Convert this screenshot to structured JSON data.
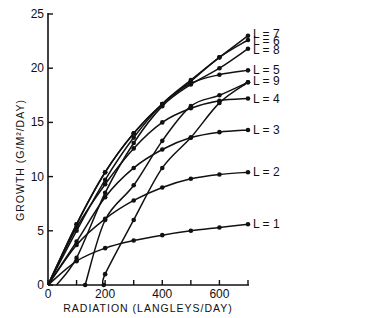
{
  "chart_data": {
    "type": "line",
    "title": "",
    "xlabel": "RADIATION (LANGLEYS/DAY)",
    "ylabel": "GROWTH (G/M²/DAY)",
    "xlim": [
      0,
      700
    ],
    "ylim": [
      0,
      25
    ],
    "x_ticks": [
      0,
      100,
      200,
      300,
      400,
      500,
      600,
      700
    ],
    "x_tick_labels": [
      "0",
      "",
      "200",
      "",
      "400",
      "",
      "600",
      ""
    ],
    "y_ticks": [
      0,
      5,
      10,
      15,
      20,
      25
    ],
    "y_tick_labels": [
      "0",
      "5",
      "10",
      "15",
      "20",
      "25"
    ],
    "grid": false,
    "legend_position": "inline-right",
    "series": [
      {
        "name": "L = 1",
        "x": [
          0,
          100,
          200,
          300,
          400,
          500,
          600,
          700
        ],
        "y": [
          0,
          2.2,
          3.4,
          4.1,
          4.6,
          5.0,
          5.3,
          5.6
        ]
      },
      {
        "name": "L = 2",
        "x": [
          0,
          100,
          200,
          300,
          400,
          500,
          600,
          700
        ],
        "y": [
          0,
          3.7,
          6.1,
          7.8,
          9.0,
          9.8,
          10.2,
          10.4
        ]
      },
      {
        "name": "L = 3",
        "x": [
          0,
          100,
          200,
          300,
          400,
          500,
          600,
          700
        ],
        "y": [
          0,
          4.0,
          8.1,
          10.8,
          12.5,
          13.6,
          14.1,
          14.3
        ]
      },
      {
        "name": "L = 4",
        "x": [
          0,
          100,
          200,
          300,
          400,
          500,
          600,
          700
        ],
        "y": [
          0,
          5.3,
          9.3,
          12.6,
          15.0,
          16.3,
          17.0,
          17.2
        ]
      },
      {
        "name": "L = 5",
        "x": [
          0,
          100,
          200,
          300,
          400,
          500,
          600,
          700
        ],
        "y": [
          0,
          5.6,
          10.4,
          14.0,
          16.7,
          18.6,
          19.4,
          19.8
        ]
      },
      {
        "name": "L = 6",
        "x": [
          0,
          100,
          200,
          300,
          400,
          500,
          600,
          700
        ],
        "y": [
          0,
          5.6,
          10.4,
          14.0,
          16.7,
          18.8,
          21.0,
          22.6
        ]
      },
      {
        "name": "L = 7",
        "x": [
          0,
          100,
          200,
          300,
          400,
          500,
          600,
          700
        ],
        "y": [
          0,
          5.0,
          9.7,
          13.6,
          16.7,
          18.9,
          21.0,
          23.0
        ]
      },
      {
        "name": "L = 8",
        "x": [
          30,
          100,
          200,
          300,
          400,
          500,
          600,
          700
        ],
        "y": [
          0,
          2.5,
          8.5,
          13.1,
          16.5,
          18.5,
          20.0,
          21.8
        ]
      },
      {
        "name": "L = 9",
        "x": [
          130,
          200,
          300,
          400,
          500,
          600,
          700
        ],
        "y": [
          0,
          6.0,
          9.2,
          13.3,
          16.5,
          17.5,
          18.7
        ]
      },
      {
        "name": "L = 9b",
        "x": [
          195,
          200,
          300,
          400,
          500,
          600,
          700
        ],
        "y": [
          0,
          1.0,
          6.0,
          10.8,
          13.6,
          16.8,
          18.7
        ]
      }
    ]
  },
  "labels": {
    "x_axis": "RADIATION   (LANGLEYS/DAY)",
    "y_axis": "GROWTH   (G/M²/DAY)",
    "series_tags": [
      "L = 7",
      "L = 6",
      "L = 8",
      "L = 5",
      "L = 9",
      "L = 4",
      "L = 3",
      "L = 2",
      "L = 1"
    ]
  }
}
